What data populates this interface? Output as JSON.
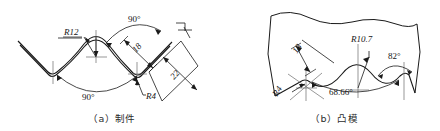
{
  "figure": {
    "background_color": "#ffffff",
    "line_color": "#1a1a1a",
    "text_color": "#161616",
    "subfigures": [
      {
        "id": "a",
        "caption": "（a）制件",
        "name": "workpiece",
        "annotations": [
          {
            "key": "r12",
            "text": "R12",
            "x": 64,
            "y": 35,
            "rotate": 0,
            "underline": true
          },
          {
            "key": "ang90t",
            "text": "90°",
            "x": 137,
            "y": 22,
            "rotate": 0,
            "underline": false
          },
          {
            "key": "ang90b",
            "text": "90°",
            "x": 89,
            "y": 97,
            "rotate": 0,
            "underline": false
          },
          {
            "key": "d18",
            "text": "18",
            "x": 144,
            "y": 52,
            "rotate": -52,
            "underline": false
          },
          {
            "key": "d22",
            "text": "22",
            "x": 181,
            "y": 80,
            "rotate": -52,
            "underline": false
          },
          {
            "key": "r4",
            "text": "R4",
            "x": 145,
            "y": 97,
            "rotate": 0,
            "underline": false
          }
        ]
      },
      {
        "id": "b",
        "caption": "（b）凸模",
        "name": "punch-die",
        "annotations": [
          {
            "key": "d18b",
            "text": "18",
            "x": 304,
            "y": 53,
            "rotate": -62,
            "underline": false
          },
          {
            "key": "r107",
            "text": "R10.7",
            "x": 352,
            "y": 43,
            "rotate": 0,
            "underline": false
          },
          {
            "key": "ang82",
            "text": "82°",
            "x": 392,
            "y": 58,
            "rotate": 0,
            "underline": false
          },
          {
            "key": "ang6866",
            "text": "68.66°",
            "x": 340,
            "y": 92,
            "rotate": 0,
            "underline": false
          },
          {
            "key": "r4b",
            "text": "R4",
            "x": 283,
            "y": 93,
            "rotate": -58,
            "underline": false
          }
        ]
      }
    ]
  }
}
